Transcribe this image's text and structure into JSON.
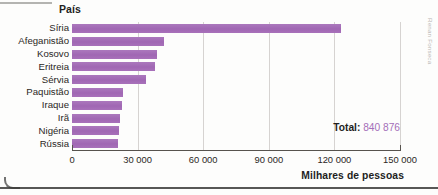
{
  "figure": {
    "category_axis_title": "País",
    "value_axis_title": "Milhares de pessoas",
    "total_label": "Total:",
    "total_value": "840 876",
    "source_credit": "Renan Fonseca",
    "bar_color": "#a46fb8",
    "total_value_color": "#a46fb8",
    "grid_color": "#d6d3d1",
    "axis_color": "#57534e"
  },
  "chart_data": {
    "type": "bar",
    "orientation": "horizontal",
    "title": "",
    "subtitle": "",
    "xlabel": "Milhares de pessoas",
    "ylabel": "País",
    "categories": [
      "Síria",
      "Afeganistão",
      "Kosovo",
      "Eritreia",
      "Sérvia",
      "Paquistão",
      "Iraque",
      "Irã",
      "Nigéria",
      "Rússia"
    ],
    "values": [
      123000,
      42000,
      39000,
      38000,
      34000,
      23500,
      23000,
      22000,
      21500,
      21000
    ],
    "xlim": [
      0,
      150000
    ],
    "xticks": [
      0,
      30000,
      60000,
      90000,
      120000,
      150000
    ],
    "xtick_labels": [
      "0",
      "30 000",
      "60 000",
      "90 000",
      "120 000",
      "150 000"
    ],
    "grid": true,
    "grid_axis": "x",
    "legend": false,
    "annotations": [
      {
        "text": "Total: 840 876",
        "position": "inside-plot-bottom-right"
      }
    ]
  }
}
